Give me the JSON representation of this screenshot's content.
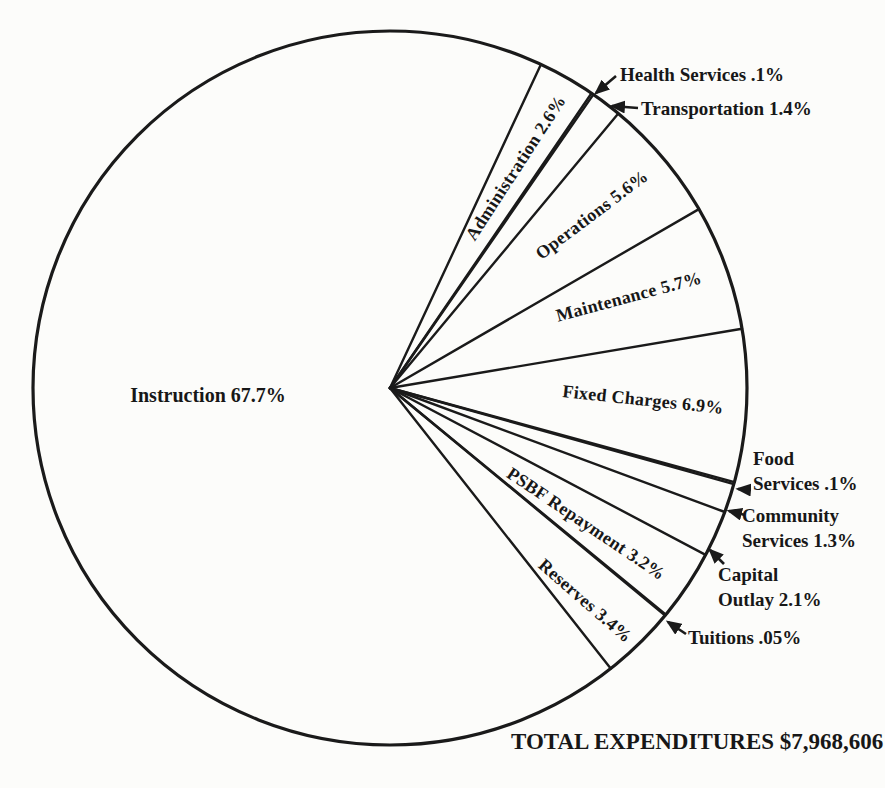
{
  "chart_data": {
    "type": "pie",
    "unit": "%",
    "direction": "clockwise",
    "start_azimuth_deg_from_12_oclock": 25,
    "total_label": "TOTAL EXPENDITURES $7,968,606",
    "total_expenditures": "$7,968,606",
    "legend_position": "labels-on-slices-and-callouts",
    "grid": false,
    "slices": [
      {
        "label": "Administration",
        "value": 2.6,
        "display": "Administration 2.6%"
      },
      {
        "label": "Health Services",
        "value": 0.1,
        "display": "Health Services .1%"
      },
      {
        "label": "Transportation",
        "value": 1.4,
        "display": "Transportation 1.4%"
      },
      {
        "label": "Operations",
        "value": 5.6,
        "display": "Operations 5.6%"
      },
      {
        "label": "Maintenance",
        "value": 5.7,
        "display": "Maintenance 5.7%"
      },
      {
        "label": "Fixed Charges",
        "value": 6.9,
        "display": "Fixed Charges 6.9%"
      },
      {
        "label": "Food Services",
        "value": 0.1,
        "display": "Food Services .1%",
        "display_lines": [
          "Food",
          "Services .1%"
        ]
      },
      {
        "label": "Community Services",
        "value": 1.3,
        "display": "Community Services 1.3%",
        "display_lines": [
          "Community",
          "Services 1.3%"
        ]
      },
      {
        "label": "Capital Outlay",
        "value": 2.1,
        "display": "Capital Outlay 2.1%",
        "display_lines": [
          "Capital",
          "Outlay 2.1%"
        ]
      },
      {
        "label": "PSBF Repayment",
        "value": 3.2,
        "display": "PSBF Repayment 3.2%"
      },
      {
        "label": "Tuitions",
        "value": 0.05,
        "display": "Tuitions .05%"
      },
      {
        "label": "Reserves",
        "value": 3.4,
        "display": "Reserves 3.4%"
      },
      {
        "label": "Instruction",
        "value": 67.7,
        "display": "Instruction 67.7%"
      }
    ]
  },
  "colors": {
    "ink": "#1a1a1a",
    "paper": "#fcfcfa"
  }
}
